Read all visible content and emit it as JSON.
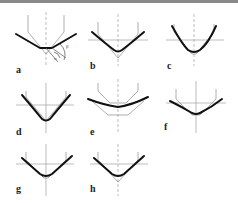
{
  "figure": {
    "panels": [
      {
        "id": "a",
        "label": "a",
        "annotations": [
          "β",
          "α"
        ]
      },
      {
        "id": "b",
        "label": "b"
      },
      {
        "id": "c",
        "label": "c"
      },
      {
        "id": "d",
        "label": "d"
      },
      {
        "id": "e",
        "label": "e"
      },
      {
        "id": "f",
        "label": "f"
      },
      {
        "id": "g",
        "label": "g"
      },
      {
        "id": "h",
        "label": "h"
      }
    ],
    "colors": {
      "curve": "#111111",
      "reference": "#9a9a9a",
      "topbar": "#8a8a8a"
    }
  }
}
